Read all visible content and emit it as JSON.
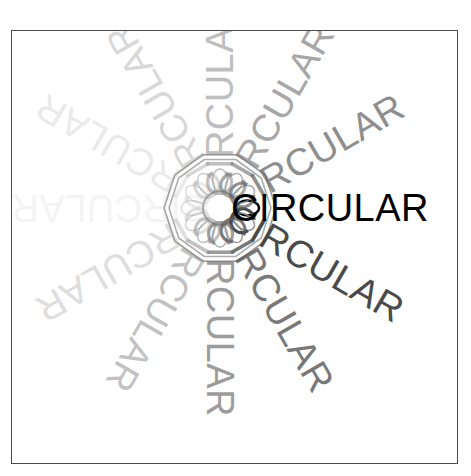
{
  "canvas": {
    "width": 471,
    "height": 476,
    "background": "#ffffff"
  },
  "frame": {
    "border_color": "#4a4a4a",
    "x": 11,
    "y": 30,
    "width": 447,
    "height": 434
  },
  "artwork": {
    "word": "CIRCULAR",
    "title": "CIRCULAR",
    "copy_count": 12,
    "angle_step_degrees": 30,
    "hub_x": 219,
    "hub_y": 207,
    "font_size_px": 38,
    "text_start_radius_px": 11,
    "rays": [
      {
        "label": "CIRCULAR",
        "angle": 0,
        "color": "#000000",
        "opacity": 1.0,
        "weight": 400
      },
      {
        "label": "CIRCULAR",
        "angle": 30,
        "color": "#3b3b3b",
        "opacity": 0.92,
        "weight": 400
      },
      {
        "label": "CIRCULAR",
        "angle": 60,
        "color": "#575757",
        "opacity": 0.8,
        "weight": 400
      },
      {
        "label": "CIRCULAR",
        "angle": 90,
        "color": "#6e6e6e",
        "opacity": 0.68,
        "weight": 400
      },
      {
        "label": "CIRCULAR",
        "angle": 120,
        "color": "#8b8b8b",
        "opacity": 0.52,
        "weight": 400
      },
      {
        "label": "CIRCULAR",
        "angle": 150,
        "color": "#aaaaaa",
        "opacity": 0.38,
        "weight": 400
      },
      {
        "label": "CIRCULAR",
        "angle": 180,
        "color": "#cfcfcf",
        "opacity": 0.22,
        "weight": 400
      },
      {
        "label": "CIRCULAR",
        "angle": 210,
        "color": "#bcbcbc",
        "opacity": 0.3,
        "weight": 400
      },
      {
        "label": "CIRCULAR",
        "angle": 240,
        "color": "#a3a3a3",
        "opacity": 0.42,
        "weight": 400
      },
      {
        "label": "CIRCULAR",
        "angle": 270,
        "color": "#8a8a8a",
        "opacity": 0.55,
        "weight": 400
      },
      {
        "label": "CIRCULAR",
        "angle": 300,
        "color": "#767676",
        "opacity": 0.64,
        "weight": 400
      },
      {
        "label": "CIRCULAR",
        "angle": 330,
        "color": "#646464",
        "opacity": 0.72,
        "weight": 400
      }
    ],
    "rosette": {
      "petal_count": 12,
      "inner_circle_radius_px": 17,
      "petal_outer_radius_px": 38,
      "decagon_radius_px": 56,
      "decagon_sides": 10,
      "stroke_color": "#8a8a8a",
      "stroke_color_dark": "#000000"
    }
  }
}
